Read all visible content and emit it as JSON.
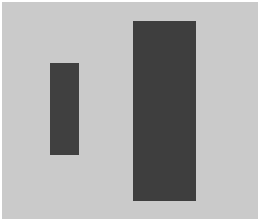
{
  "figure": {
    "background_color": "#cacaca",
    "margin_color": "#ffffff",
    "shapes": [
      {
        "name": "small-rectangle",
        "left": 50,
        "top": 63,
        "width": 29,
        "height": 92,
        "color": "#404040"
      },
      {
        "name": "large-rectangle",
        "left": 133,
        "top": 21,
        "width": 63,
        "height": 180,
        "color": "#3e3e3e"
      }
    ]
  }
}
